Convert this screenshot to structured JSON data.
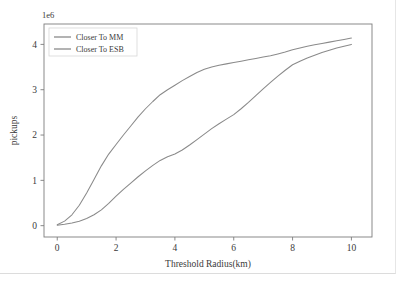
{
  "chart_data": {
    "type": "line",
    "title": "",
    "subtitle": "",
    "xlabel": "Threshold Radius(km)",
    "ylabel": "pickups",
    "y_exponent_label": "1e6",
    "y_scale_multiplier": 1000000,
    "xlim": [
      -0.45,
      10.7
    ],
    "ylim": [
      -0.25,
      4.45
    ],
    "xticks": [
      0,
      2,
      4,
      6,
      8,
      10
    ],
    "xticklabels": [
      "0",
      "2",
      "4",
      "6",
      "8",
      "10"
    ],
    "yticks": [
      0,
      1,
      2,
      3,
      4
    ],
    "yticklabels": [
      "0",
      "1",
      "2",
      "3",
      "4"
    ],
    "grid": false,
    "legend_position": "upper left",
    "legend_entries": [
      "Closer To MM",
      "Closer To ESB"
    ],
    "x": [
      0,
      0.25,
      0.5,
      0.75,
      1,
      1.25,
      1.5,
      1.75,
      2,
      2.25,
      2.5,
      2.75,
      3,
      3.25,
      3.5,
      3.75,
      4,
      4.25,
      4.5,
      4.75,
      5,
      5.25,
      5.5,
      5.75,
      6,
      6.25,
      6.5,
      6.75,
      7,
      7.25,
      7.5,
      7.75,
      8,
      8.25,
      8.5,
      8.75,
      9,
      9.25,
      9.5,
      9.75,
      10
    ],
    "series": [
      {
        "name": "Closer To MM",
        "color": "#8a8a8a",
        "values": [
          0.02,
          0.1,
          0.24,
          0.45,
          0.72,
          1.02,
          1.32,
          1.58,
          1.79,
          2.0,
          2.2,
          2.4,
          2.58,
          2.74,
          2.89,
          3.0,
          3.1,
          3.2,
          3.29,
          3.38,
          3.45,
          3.5,
          3.54,
          3.57,
          3.6,
          3.63,
          3.66,
          3.69,
          3.72,
          3.75,
          3.79,
          3.83,
          3.88,
          3.92,
          3.96,
          3.99,
          4.02,
          4.05,
          4.08,
          4.11,
          4.14
        ]
      },
      {
        "name": "Closer To ESB",
        "color": "#8a8a8a",
        "values": [
          0.01,
          0.03,
          0.06,
          0.1,
          0.16,
          0.24,
          0.35,
          0.49,
          0.65,
          0.8,
          0.94,
          1.08,
          1.21,
          1.33,
          1.44,
          1.52,
          1.58,
          1.67,
          1.78,
          1.9,
          2.02,
          2.14,
          2.25,
          2.35,
          2.45,
          2.58,
          2.72,
          2.87,
          3.02,
          3.16,
          3.3,
          3.43,
          3.55,
          3.63,
          3.7,
          3.76,
          3.82,
          3.87,
          3.92,
          3.96,
          4.0
        ]
      }
    ]
  }
}
